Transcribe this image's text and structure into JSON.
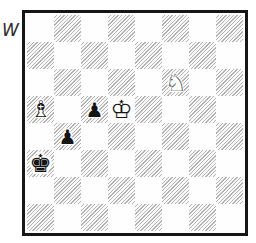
{
  "page": {
    "background_color": "#ffffff",
    "move_indicator": "W",
    "move_indicator_meaning": "white-to-move"
  },
  "board": {
    "files": [
      "a",
      "b",
      "c",
      "d",
      "e",
      "f",
      "g",
      "h"
    ],
    "ranks": [
      8,
      7,
      6,
      5,
      4,
      3,
      2,
      1
    ],
    "border_color": "#161616",
    "light_square_color": "#fefefe",
    "dark_square_hatch_color": "#b3b3b3",
    "dark_square_style": "diagonal-hatch",
    "pieces": [
      {
        "square": "a5",
        "color": "white",
        "type": "bishop",
        "glyph": "♗",
        "halo_glyph": "♝",
        "halo": "normal"
      },
      {
        "square": "c5",
        "color": "black",
        "type": "pawn",
        "glyph": "♟",
        "halo_glyph": "♟",
        "halo": "normal"
      },
      {
        "square": "d5",
        "color": "white",
        "type": "king",
        "glyph": "♔",
        "halo_glyph": "♚",
        "halo": "normal"
      },
      {
        "square": "f6",
        "color": "white",
        "type": "knight",
        "glyph": "♘",
        "halo_glyph": "♞",
        "halo": "normal"
      },
      {
        "square": "b4",
        "color": "black",
        "type": "pawn",
        "glyph": "♟",
        "halo_glyph": "♟",
        "halo": "normal"
      },
      {
        "square": "a3",
        "color": "black",
        "type": "king",
        "glyph": "♚",
        "halo_glyph": "♚",
        "halo": "large"
      }
    ]
  }
}
